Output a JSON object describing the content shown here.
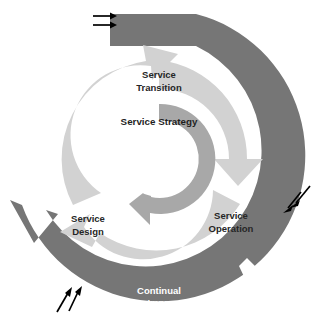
{
  "diagram": {
    "type": "concentric-ring-cycle",
    "background_color": "#ffffff",
    "rings": [
      {
        "id": "outer-ring",
        "name": "continual-service-improvement-ring",
        "label_line1": "Continual",
        "label_line2": "Service Improvement",
        "label_position": "bottom",
        "label_color": "#ffffff",
        "fill_color": "#767676",
        "has_arrowheads": true,
        "arrowhead_count": 3,
        "arrowhead_positions": [
          "left",
          "bottom-right",
          "top-right"
        ]
      },
      {
        "id": "middle-ring",
        "name": "service-lifecycle-arrow-ring",
        "fill_color": "#d2d2d2",
        "has_arrowheads": true,
        "arrowhead_count": 3,
        "segments": [
          {
            "id": "service-transition",
            "label_line1": "Service",
            "label_line2": "Transition",
            "label_color": "#262626",
            "position": "top"
          },
          {
            "id": "service-design",
            "label_line1": "Service",
            "label_line2": "Design",
            "label_color": "#262626",
            "position": "bottom-left"
          },
          {
            "id": "service-operation",
            "label_line1": "Service",
            "label_line2": "Operation",
            "label_color": "#262626",
            "position": "bottom-right"
          }
        ]
      },
      {
        "id": "inner-ring",
        "name": "service-strategy-ring",
        "label": "Service Strategy",
        "label_position": "top",
        "label_color": "#1f1f1f",
        "fill_color": "#a8a8a8",
        "has_arrowheads": true,
        "arrowhead_count": 1,
        "arrowhead_positions": [
          "bottom"
        ]
      },
      {
        "id": "hub",
        "name": "center-hub",
        "fill_color": "#ffffff"
      }
    ],
    "input_arrows": [
      {
        "id": "input-arrows-top-left",
        "name": "requirements-input-arrows",
        "count": 2,
        "direction": "right",
        "color": "#000000",
        "position": "top-left"
      },
      {
        "id": "input-arrows-right",
        "name": "feedback-input-arrows-right",
        "count": 2,
        "direction": "down-left",
        "color": "#000000",
        "position": "middle-right"
      },
      {
        "id": "input-arrows-bottom-left",
        "name": "feedback-input-arrows-bottom-left",
        "count": 2,
        "direction": "up-right",
        "color": "#000000",
        "position": "bottom-left"
      }
    ]
  }
}
